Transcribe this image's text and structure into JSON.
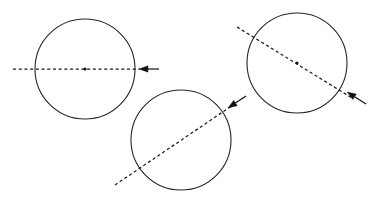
{
  "figure": {
    "background_color": "#ffffff",
    "stroke_color": "#262626",
    "dash_color": "#1c1c1c",
    "arrow_color": "#111111",
    "width": 372,
    "height": 202
  },
  "chart_data": {
    "type": "diagram",
    "xlabel": "",
    "ylabel": "",
    "grid": false,
    "legend": false,
    "xlim": [
      0,
      372
    ],
    "ylim": [
      0,
      202
    ],
    "shapes": [
      {
        "name": "circle-left",
        "kind": "circle",
        "cx": 85,
        "cy": 69,
        "r": 50,
        "center_dot": true,
        "center_dot_r": 1.6,
        "axis": {
          "name": "axis-left",
          "style": "dashed",
          "angle_deg": 0,
          "x1": 13,
          "y1": 69,
          "x2": 140,
          "y2": 69
        },
        "arrow": {
          "name": "arrow-left",
          "direction": "left",
          "points_toward": "circle",
          "tip_x": 139,
          "tip_y": 69,
          "tail_x": 159,
          "tail_y": 69,
          "head_length": 9,
          "head_halfwidth": 3.2
        }
      },
      {
        "name": "circle-middle",
        "kind": "circle",
        "cx": 181,
        "cy": 140,
        "r": 50,
        "center_dot": false,
        "center_dot_r": 1.6,
        "axis": {
          "name": "axis-middle",
          "style": "dashed",
          "angle_deg": -42,
          "x1": 115,
          "y1": 185,
          "x2": 233,
          "y2": 105
        },
        "arrow": {
          "name": "arrow-middle",
          "direction": "down-left",
          "points_toward": "circle",
          "tip_x": 228,
          "tip_y": 108,
          "tail_x": 246,
          "tail_y": 96,
          "head_length": 9,
          "head_halfwidth": 3.2
        }
      },
      {
        "name": "circle-right",
        "kind": "circle",
        "cx": 297,
        "cy": 63,
        "r": 50,
        "center_dot": true,
        "center_dot_r": 1.6,
        "axis": {
          "name": "axis-right",
          "style": "dashed",
          "angle_deg": 38,
          "x1": 237,
          "y1": 27,
          "x2": 352,
          "y2": 98
        },
        "arrow": {
          "name": "arrow-right",
          "direction": "up-left",
          "points_toward": "circle",
          "tip_x": 347,
          "tip_y": 92,
          "tail_x": 366,
          "tail_y": 104,
          "head_length": 9,
          "head_halfwidth": 3.2
        }
      }
    ]
  }
}
